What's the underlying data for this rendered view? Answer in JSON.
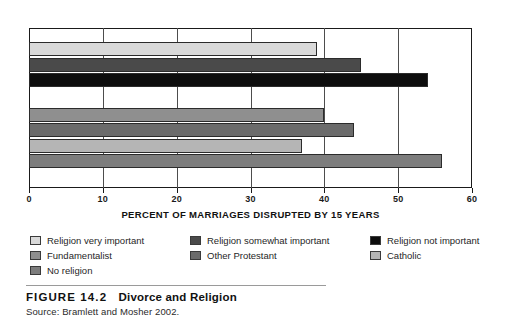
{
  "figure": {
    "label": "FIGURE 14.2",
    "title": "Divorce and Religion",
    "source": "Source: Bramlett and Mosher 2002."
  },
  "chart_data": {
    "type": "bar",
    "orientation": "horizontal",
    "title": "Divorce and Religion",
    "xlabel": "PERCENT OF MARRIAGES DISRUPTED BY 15 YEARS",
    "ylabel": "",
    "xlim": [
      0,
      60
    ],
    "xticks": [
      0,
      10,
      20,
      30,
      40,
      50,
      60
    ],
    "grid": true,
    "legend_position": "below",
    "categories": [
      "Religion very important",
      "Religion somewhat important",
      "Religion not important",
      "Fundamentalist",
      "Other Protestant",
      "Catholic",
      "No religion"
    ],
    "values": [
      39,
      45,
      54,
      40,
      44,
      37,
      56
    ],
    "colors": [
      "#d9d9d9",
      "#4a4a4a",
      "#0d0d0d",
      "#8f8f8f",
      "#6b6b6b",
      "#b5b5b5",
      "#7d7d7d"
    ],
    "groups": [
      {
        "name": "Religiosity",
        "indices": [
          0,
          1,
          2
        ]
      },
      {
        "name": "Denomination",
        "indices": [
          3,
          4,
          5,
          6
        ]
      }
    ]
  },
  "legend": {
    "items": [
      {
        "label": "Religion very important",
        "color": "#d9d9d9"
      },
      {
        "label": "Religion somewhat important",
        "color": "#4a4a4a"
      },
      {
        "label": "Religion not important",
        "color": "#0d0d0d"
      },
      {
        "label": "Fundamentalist",
        "color": "#8f8f8f"
      },
      {
        "label": "Other Protestant",
        "color": "#6b6b6b"
      },
      {
        "label": "Catholic",
        "color": "#b5b5b5"
      },
      {
        "label": "No religion",
        "color": "#7d7d7d"
      }
    ]
  }
}
